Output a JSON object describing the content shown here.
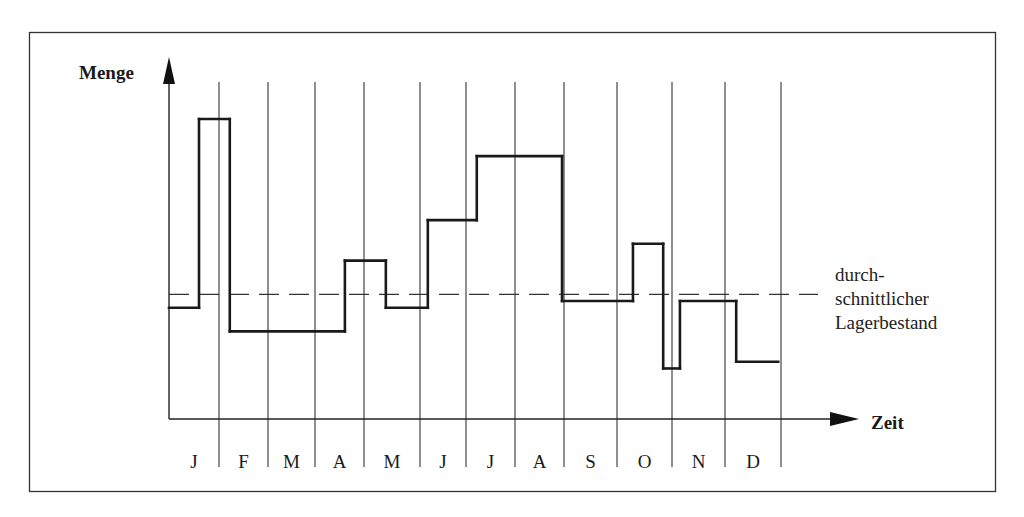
{
  "chart_data": {
    "type": "line",
    "subtype": "step",
    "title": "",
    "ylabel": "Menge",
    "xlabel": "Zeit",
    "categories": [
      "J",
      "F",
      "M",
      "A",
      "M",
      "J",
      "J",
      "A",
      "S",
      "O",
      "N",
      "D"
    ],
    "xlim_months": [
      0,
      12
    ],
    "ylim": [
      0,
      100
    ],
    "y_ticks": "none",
    "grid": "vertical month separators",
    "series": [
      {
        "name": "Lagerbestand",
        "style": "solid-step",
        "color": "#1a1a1a",
        "steps": [
          {
            "from": 0.0,
            "to": 0.6,
            "value": 33
          },
          {
            "from": 0.6,
            "to": 1.22,
            "value": 89
          },
          {
            "from": 1.22,
            "to": 3.61,
            "value": 26
          },
          {
            "from": 3.61,
            "to": 4.39,
            "value": 47
          },
          {
            "from": 4.39,
            "to": 5.17,
            "value": 33
          },
          {
            "from": 5.17,
            "to": 6.22,
            "value": 59
          },
          {
            "from": 6.22,
            "to": 7.96,
            "value": 78
          },
          {
            "from": 7.96,
            "to": 9.29,
            "value": 35
          },
          {
            "from": 9.29,
            "to": 9.84,
            "value": 52
          },
          {
            "from": 9.84,
            "to": 10.15,
            "value": 15
          },
          {
            "from": 10.15,
            "to": 11.2,
            "value": 35
          },
          {
            "from": 11.2,
            "to": 11.95,
            "value": 17
          }
        ]
      },
      {
        "name": "durchschnittlicher Lagerbestand",
        "style": "dashed-horizontal",
        "color": "#1a1a1a",
        "value": 37
      }
    ],
    "annotations": [
      {
        "lines": [
          "durch-",
          "schnittlicher",
          "Lagerbestand"
        ],
        "refers_to": "durchschnittlicher Lagerbestand",
        "placement": "right"
      }
    ]
  },
  "labels": {
    "y_axis": "Menge",
    "x_axis": "Zeit",
    "legend_lines": [
      "durch-",
      "schnittlicher",
      "Lagerbestand"
    ]
  }
}
